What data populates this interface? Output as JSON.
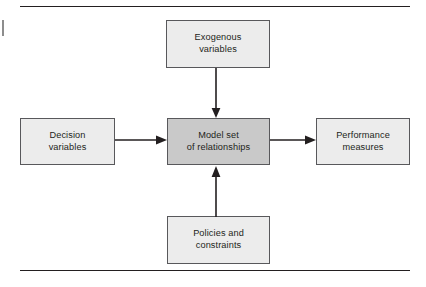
{
  "figure": {
    "title": "",
    "type": "block-flow-diagram",
    "rules": {
      "top_label": "top-divider",
      "bottom_label": "bottom-divider"
    },
    "colors": {
      "box_fill_light": "#ececec",
      "box_fill_dark": "#c9c9c9",
      "box_border": "#58585b",
      "text": "#231f20",
      "connector": "#231f20",
      "rule": "#231f20"
    },
    "boxes": [
      {
        "id": "exogenous",
        "name": "exogenous-variables",
        "line1": "Exogenous",
        "line2": "variables",
        "fill": "#ececec"
      },
      {
        "id": "decision",
        "name": "decision-variables",
        "line1": "Decision",
        "line2": "variables",
        "fill": "#ececec"
      },
      {
        "id": "model",
        "name": "model-set-of-relationships",
        "line1": "Model set",
        "line2": "of relationships",
        "fill": "#c9c9c9"
      },
      {
        "id": "performance",
        "name": "performance-measures",
        "line1": "Performance",
        "line2": "measures",
        "fill": "#ececec"
      },
      {
        "id": "policies",
        "name": "policies-and-constraints",
        "line1": "Policies and",
        "line2": "constraints",
        "fill": "#ececec"
      }
    ],
    "arrows": [
      {
        "id": "exogenous-to-model",
        "from": "exogenous",
        "to": "model",
        "direction": "down"
      },
      {
        "id": "decision-to-model",
        "from": "decision",
        "to": "model",
        "direction": "right"
      },
      {
        "id": "model-to-performance",
        "from": "model",
        "to": "performance",
        "direction": "right"
      },
      {
        "id": "policies-to-model",
        "from": "policies",
        "to": "model",
        "direction": "up"
      }
    ]
  }
}
